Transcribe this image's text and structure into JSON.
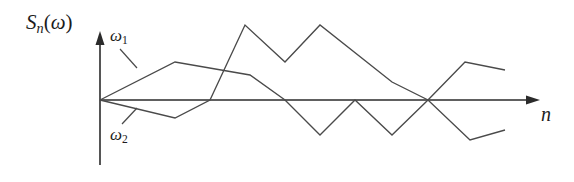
{
  "figure": {
    "type": "line-plot",
    "background_color": "#ffffff",
    "line_color": "#4a4a4a",
    "axis_color": "#2b2b2b",
    "labels": {
      "y_axis": "S_n(omega)",
      "y_axis_parts": {
        "base": "S",
        "subscript": "n",
        "arg": "ω"
      },
      "x_axis": "n",
      "series_1": {
        "base": "ω",
        "subscript": "1"
      },
      "series_2": {
        "base": "ω",
        "subscript": "2"
      }
    },
    "axes": {
      "origin": [
        100,
        100
      ],
      "x_axis_from": [
        100,
        100
      ],
      "x_axis_to": [
        540,
        100
      ],
      "y_axis_from": [
        100,
        165
      ],
      "y_axis_to": [
        100,
        32
      ],
      "x_arrow": true,
      "y_arrow": true,
      "ticks": [],
      "gridlines": false
    }
  },
  "chart_data": {
    "type": "line",
    "title": "",
    "subtitle": "",
    "xlabel": "n",
    "ylabel": "S_n(ω)",
    "xlim": [
      0,
      540
    ],
    "ylim": [
      -70,
      80
    ],
    "grid": false,
    "legend": "inline-annotations",
    "annotations": [
      {
        "text": "ω₁",
        "target_series": "omega_1",
        "x": 118,
        "y": 36
      },
      {
        "text": "ω₂",
        "target_series": "omega_2",
        "x": 118,
        "y": 137
      }
    ],
    "note": "Two sample paths of a random walk S_n(ω) against step index n; coordinates are in screenshot pixel space with the origin at (100,100) and y increasing downward.",
    "series": [
      {
        "name": "ω₁",
        "id": "omega_1",
        "color": "#4a4a4a",
        "points_px": [
          [
            100,
            100
          ],
          [
            175,
            62
          ],
          [
            250,
            75
          ],
          [
            285,
            100
          ],
          [
            320,
            135
          ],
          [
            355,
            100
          ],
          [
            392,
            135
          ],
          [
            428,
            100
          ],
          [
            465,
            62
          ],
          [
            505,
            70
          ]
        ],
        "values": [
          0,
          38,
          25,
          0,
          -35,
          0,
          -35,
          0,
          38,
          30
        ]
      },
      {
        "name": "ω₂",
        "id": "omega_2",
        "color": "#4a4a4a",
        "points_px": [
          [
            100,
            100
          ],
          [
            175,
            118
          ],
          [
            210,
            100
          ],
          [
            245,
            25
          ],
          [
            285,
            62
          ],
          [
            320,
            25
          ],
          [
            392,
            82
          ],
          [
            428,
            100
          ],
          [
            470,
            140
          ],
          [
            505,
            130
          ]
        ],
        "values": [
          0,
          -18,
          0,
          75,
          38,
          75,
          18,
          0,
          -40,
          -30
        ]
      }
    ]
  }
}
